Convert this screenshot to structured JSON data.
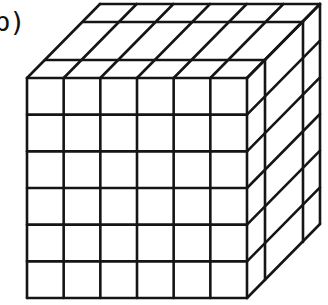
{
  "label": "b)",
  "diagram": {
    "front_columns": 6,
    "front_rows": 6,
    "depth_layers": 3,
    "front_face": {
      "left": 27,
      "top": 78,
      "right": 247,
      "bottom": 298
    },
    "depth_y": [
      78,
      60,
      22,
      4
    ],
    "depth_dx": [
      0,
      18,
      56,
      73
    ],
    "stroke_color": "#151515",
    "background": "#ffffff"
  }
}
